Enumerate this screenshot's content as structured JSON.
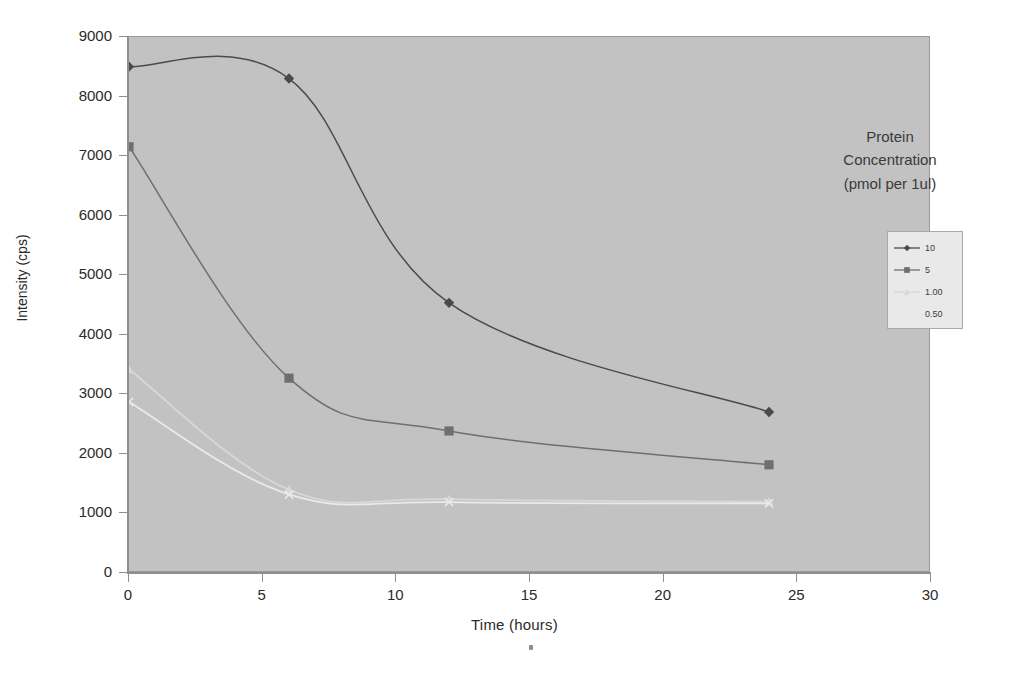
{
  "chart_data": {
    "type": "line",
    "title": "",
    "xlabel": "Time (hours)",
    "ylabel": "Intensity (cps)",
    "xlim": [
      0,
      30
    ],
    "ylim": [
      0,
      9000
    ],
    "x_ticks": [
      0,
      5,
      10,
      15,
      20,
      25,
      30
    ],
    "y_ticks": [
      0,
      1000,
      2000,
      3000,
      4000,
      5000,
      6000,
      7000,
      8000,
      9000
    ],
    "x_tick_labels": [
      "0",
      "5",
      "10",
      "15",
      "20",
      "25",
      "30"
    ],
    "y_tick_labels": [
      "0",
      "1000",
      "2000",
      "3000",
      "4000",
      "5000",
      "6000",
      "7000",
      "8000",
      "9000"
    ],
    "grid": false,
    "legend_position": "right",
    "legend_title": "Protein Concentration (pmol per 1ul)",
    "x": [
      0,
      6,
      12,
      24
    ],
    "series": [
      {
        "name": "10",
        "marker": "diamond",
        "color": "#4a4a4a",
        "values": [
          8500,
          8300,
          4520,
          2680
        ]
      },
      {
        "name": "5",
        "marker": "square",
        "color": "#6f6f6f",
        "values": [
          7150,
          3250,
          2360,
          1790
        ]
      },
      {
        "name": "1.00",
        "marker": "triangle",
        "color": "#d8d8d8",
        "values": [
          3400,
          1370,
          1210,
          1170
        ]
      },
      {
        "name": "0.50",
        "marker": "cross",
        "color": "#eaeaea",
        "values": [
          2850,
          1290,
          1160,
          1140
        ]
      }
    ]
  },
  "legend_title_lines": {
    "line1": "Protein",
    "line2": "Concentration",
    "line3": "(pmol per 1ul)"
  },
  "axis": {
    "x_title": "Time (hours)",
    "y_title": "Intensity (cps)"
  }
}
